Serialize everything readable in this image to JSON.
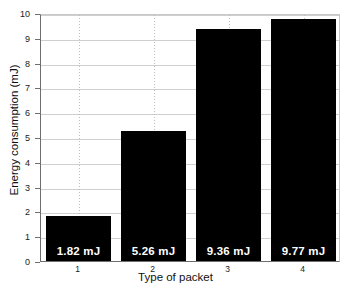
{
  "chart_data": {
    "type": "bar",
    "title": "",
    "xlabel": "Type of packet",
    "ylabel": "Energy consumption (mJ)",
    "categories": [
      "1",
      "2",
      "3",
      "4"
    ],
    "values": [
      1.82,
      5.26,
      9.36,
      9.77
    ],
    "data_labels": [
      "1.82 mJ",
      "5.26 mJ",
      "9.36 mJ",
      "9.77 mJ"
    ],
    "ylim": [
      0,
      10
    ],
    "yticks": [
      "0",
      "1",
      "2",
      "3",
      "4",
      "5",
      "6",
      "7",
      "8",
      "9",
      "10"
    ],
    "xticks": [
      "1",
      "2",
      "3",
      "4"
    ],
    "grid": "both",
    "legend": "none",
    "bar_color": "#000000",
    "label_color": "#ffffff",
    "background_color": "#ffffff",
    "axis_color": "#6e6e6e",
    "gridline_color": "#cfcfcf"
  }
}
